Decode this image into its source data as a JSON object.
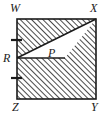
{
  "figure": {
    "name": "hatched-square-with-inscribed-triangle",
    "shape_type": "square",
    "vertices": [
      {
        "id": "W",
        "label": "W",
        "position": "top-left",
        "x": 17,
        "y": 19
      },
      {
        "id": "X",
        "label": "X",
        "position": "top-right",
        "x": 96,
        "y": 19
      },
      {
        "id": "Y",
        "label": "Y",
        "position": "bottom-right",
        "x": 96,
        "y": 99
      },
      {
        "id": "Z",
        "label": "Z",
        "position": "bottom-left",
        "x": 17,
        "y": 99
      }
    ],
    "points": [
      {
        "id": "R",
        "label": "R",
        "on_segment": "WZ",
        "x": 17,
        "y": 58
      }
    ],
    "regions": [
      {
        "id": "P",
        "label": "P",
        "description": "unshaded triangle",
        "fill": "white",
        "triangle_points": "17,58 96,19 65,58"
      }
    ],
    "tick_marks": [
      {
        "id": "tick-upper",
        "on_segment": "WR",
        "x": 17,
        "y": 40,
        "count": 1
      },
      {
        "id": "tick-lower",
        "on_segment": "RZ",
        "x": 17,
        "y": 78,
        "count": 1
      }
    ],
    "hatching": {
      "style": "diagonal-lines",
      "direction": "bottom-left-to-top-right",
      "spacing_px": 4,
      "color": "#2b2b2b"
    },
    "colors": {
      "stroke": "#1b1b1b",
      "hatch": "#2b2b2b",
      "background": "#ffffff",
      "unshaded_fill": "#ffffff"
    }
  }
}
